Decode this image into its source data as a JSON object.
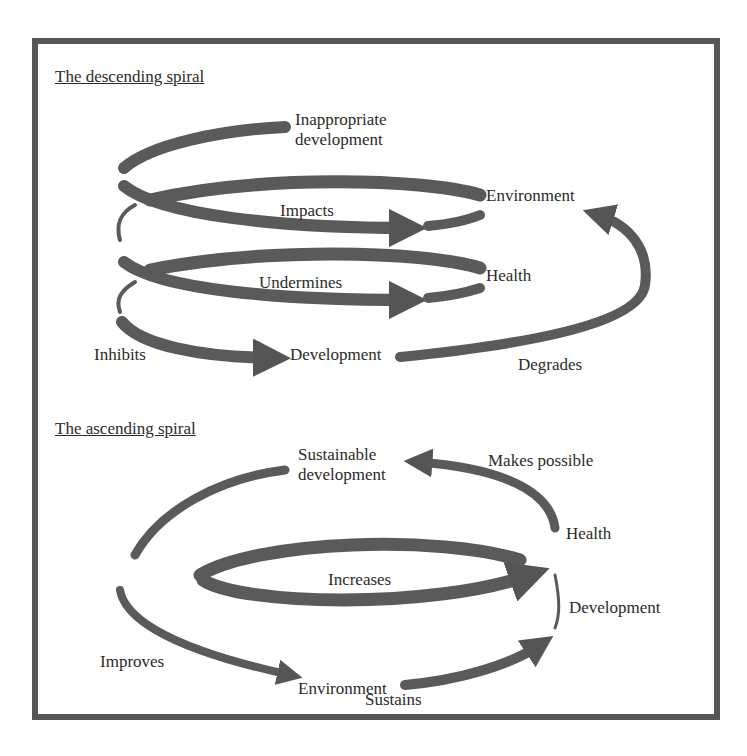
{
  "descending": {
    "title": "The descending spiral",
    "labels": {
      "inappropriate_1": "Inappropriate",
      "inappropriate_2": "development",
      "environment": "Environment",
      "impacts": "Impacts",
      "health": "Health",
      "undermines": "Undermines",
      "inhibits": "Inhibits",
      "development": "Development",
      "degrades": "Degrades"
    }
  },
  "ascending": {
    "title": "The ascending spiral",
    "labels": {
      "sustainable_1": "Sustainable",
      "sustainable_2": "development",
      "makes_possible": "Makes possible",
      "health": "Health",
      "increases": "Increases",
      "development": "Development",
      "improves": "Improves",
      "environment": "Environment",
      "sustains": "Sustains"
    }
  },
  "colors": {
    "arrow": "#5a5a5a",
    "frame": "#565656",
    "text": "#2b2b2b"
  }
}
